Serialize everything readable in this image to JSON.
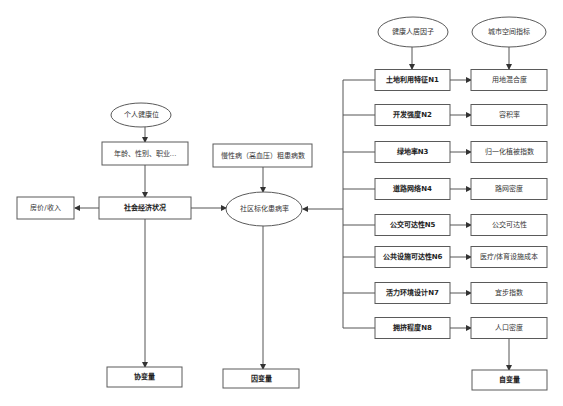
{
  "diagram": {
    "top_headers": {
      "health_factor": "健康人居因子",
      "urban_index": "城市空间指标"
    },
    "factors": [
      {
        "label": "土地利用特征N1",
        "indicator": "用地混合度"
      },
      {
        "label": "开发强度N2",
        "indicator": "容积率"
      },
      {
        "label": "绿地率N3",
        "indicator": "归一化植被指数"
      },
      {
        "label": "道路网络N4",
        "indicator": "路网密度"
      },
      {
        "label": "公交可达性N5",
        "indicator": "公交可达性"
      },
      {
        "label": "公共设施可达性N6",
        "indicator": "医疗/体育设施成本"
      },
      {
        "label": "活力环境设计N7",
        "indicator": "宜步指数"
      },
      {
        "label": "拥挤程度N8",
        "indicator": "人口密度"
      }
    ],
    "independent_variable": "自变量",
    "personal_health": "个人健康位",
    "demographics": "年龄、性别、职业…",
    "socioeconomic": "社会经济状况",
    "house_price_income": "房价/收入",
    "covariate": "协变量",
    "chronic_disease": "慢性病（高血压）粗患病数",
    "standardized_prevalence": "社区标化患病率",
    "dependent_variable": "因变量"
  }
}
